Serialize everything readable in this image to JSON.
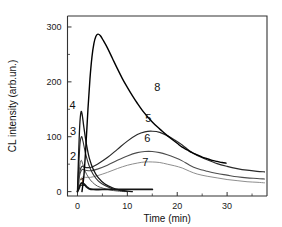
{
  "chart_data": {
    "type": "line",
    "title": "",
    "xlabel": "Time (min)",
    "ylabel": "CL intensity (arb.un.)",
    "xlim": [
      -2,
      38
    ],
    "ylim": [
      -8,
      320
    ],
    "xticks": [
      0,
      10,
      20,
      30
    ],
    "yticks": [
      0,
      100,
      200,
      300
    ],
    "xtick_labels": [
      "0",
      "10",
      "20",
      "30"
    ],
    "ytick_labels": [
      "0",
      "100",
      "200",
      "300"
    ],
    "grid": false,
    "legend": "inline curve numbers",
    "series": [
      {
        "name": "1",
        "label": "1",
        "label_x": 1.0,
        "label_y": 10,
        "color": "#141414",
        "width": 1.9,
        "points": [
          [
            0,
            0
          ],
          [
            0.3,
            6
          ],
          [
            0.6,
            13
          ],
          [
            0.9,
            16
          ],
          [
            1.3,
            14
          ],
          [
            1.8,
            9
          ],
          [
            2.4,
            5
          ],
          [
            3.2,
            4
          ],
          [
            5,
            4
          ],
          [
            8,
            4
          ],
          [
            11,
            4
          ],
          [
            15,
            4
          ]
        ]
      },
      {
        "name": "2",
        "label": "2",
        "label_x": -0.9,
        "label_y": 58,
        "color": "#5a5a5a",
        "width": 1.0,
        "points": [
          [
            0,
            0
          ],
          [
            0.25,
            26
          ],
          [
            0.5,
            50
          ],
          [
            0.75,
            57
          ],
          [
            1.0,
            52
          ],
          [
            1.5,
            38
          ],
          [
            2.2,
            26
          ],
          [
            3.0,
            17
          ],
          [
            4.0,
            10
          ],
          [
            5.2,
            6
          ],
          [
            6.5,
            3
          ],
          [
            8,
            1
          ],
          [
            9.5,
            0
          ]
        ]
      },
      {
        "name": "3",
        "label": "3",
        "label_x": -0.9,
        "label_y": 104,
        "color": "#2e2e2e",
        "width": 1.1,
        "points": [
          [
            0,
            0
          ],
          [
            0.25,
            45
          ],
          [
            0.5,
            86
          ],
          [
            0.8,
            100
          ],
          [
            1.1,
            92
          ],
          [
            1.6,
            70
          ],
          [
            2.3,
            48
          ],
          [
            3.1,
            32
          ],
          [
            4.2,
            19
          ],
          [
            5.5,
            11
          ],
          [
            7,
            5
          ],
          [
            8.5,
            2
          ],
          [
            10,
            0
          ]
        ]
      },
      {
        "name": "4",
        "label": "4",
        "label_x": -1.0,
        "label_y": 151,
        "color": "#141414",
        "width": 1.3,
        "points": [
          [
            0,
            0
          ],
          [
            0.2,
            60
          ],
          [
            0.45,
            120
          ],
          [
            0.7,
            145
          ],
          [
            0.95,
            140
          ],
          [
            1.3,
            116
          ],
          [
            1.8,
            86
          ],
          [
            2.4,
            60
          ],
          [
            3.2,
            40
          ],
          [
            4.2,
            25
          ],
          [
            5.5,
            14
          ],
          [
            7,
            7
          ],
          [
            8.5,
            3
          ],
          [
            10,
            1
          ],
          [
            11,
            0
          ]
        ]
      },
      {
        "name": "5",
        "label": "5",
        "label_x": 14.2,
        "label_y": 126,
        "color": "#2a2a2a",
        "width": 1.2,
        "points": [
          [
            0,
            0
          ],
          [
            0.4,
            34
          ],
          [
            0.9,
            46
          ],
          [
            1.6,
            44
          ],
          [
            2.6,
            44
          ],
          [
            4,
            50
          ],
          [
            6,
            62
          ],
          [
            8,
            77
          ],
          [
            10,
            92
          ],
          [
            12,
            104
          ],
          [
            13.5,
            109
          ],
          [
            15,
            110
          ],
          [
            16.5,
            108
          ],
          [
            18,
            102
          ],
          [
            19.5,
            94
          ],
          [
            21,
            85
          ],
          [
            22.5,
            74
          ],
          [
            24,
            66
          ],
          [
            26,
            58
          ],
          [
            28,
            51
          ],
          [
            30,
            46
          ],
          [
            32,
            42
          ],
          [
            34,
            39
          ],
          [
            36,
            37
          ],
          [
            37.5,
            36
          ]
        ]
      },
      {
        "name": "6",
        "label": "6",
        "label_x": 14.0,
        "label_y": 90,
        "color": "#4d4d4d",
        "width": 1.1,
        "points": [
          [
            0,
            0
          ],
          [
            0.4,
            28
          ],
          [
            0.9,
            40
          ],
          [
            1.6,
            39
          ],
          [
            2.6,
            38
          ],
          [
            4,
            41
          ],
          [
            6,
            48
          ],
          [
            8,
            57
          ],
          [
            10,
            65
          ],
          [
            12,
            71
          ],
          [
            13.5,
            73
          ],
          [
            15,
            73
          ],
          [
            16.5,
            71
          ],
          [
            18,
            67
          ],
          [
            19.5,
            62
          ],
          [
            21,
            56
          ],
          [
            22.5,
            48
          ],
          [
            24,
            42
          ],
          [
            26,
            37
          ],
          [
            28,
            33
          ],
          [
            30,
            30
          ],
          [
            32,
            27
          ],
          [
            34,
            25
          ],
          [
            36,
            24
          ],
          [
            37.5,
            23
          ]
        ]
      },
      {
        "name": "7",
        "label": "7",
        "label_x": 13.6,
        "label_y": 47,
        "color": "#8e8e8e",
        "width": 1.0,
        "points": [
          [
            0,
            0
          ],
          [
            0.4,
            18
          ],
          [
            0.9,
            26
          ],
          [
            1.6,
            26
          ],
          [
            2.6,
            26
          ],
          [
            4,
            29
          ],
          [
            6,
            35
          ],
          [
            8,
            42
          ],
          [
            10,
            48
          ],
          [
            12,
            52
          ],
          [
            13.5,
            54
          ],
          [
            15,
            54
          ],
          [
            16.5,
            53
          ],
          [
            18,
            50
          ],
          [
            19.5,
            47
          ],
          [
            21,
            43
          ],
          [
            22.5,
            37
          ],
          [
            24,
            32
          ],
          [
            26,
            28
          ],
          [
            28,
            25
          ],
          [
            30,
            22
          ],
          [
            32,
            20
          ],
          [
            34,
            18
          ],
          [
            36,
            17
          ],
          [
            37.5,
            16
          ]
        ]
      },
      {
        "name": "8",
        "label": "8",
        "label_x": 16.0,
        "label_y": 183,
        "color": "#000000",
        "width": 1.4,
        "points": [
          [
            0.9,
            0
          ],
          [
            1.3,
            30
          ],
          [
            1.7,
            85
          ],
          [
            2.1,
            150
          ],
          [
            2.5,
            205
          ],
          [
            2.9,
            245
          ],
          [
            3.3,
            270
          ],
          [
            3.7,
            283
          ],
          [
            4.1,
            287
          ],
          [
            4.6,
            284
          ],
          [
            5.2,
            275
          ],
          [
            6,
            262
          ],
          [
            7,
            243
          ],
          [
            8,
            224
          ],
          [
            9,
            206
          ],
          [
            10,
            190
          ],
          [
            11,
            175
          ],
          [
            12,
            161
          ],
          [
            13,
            148
          ],
          [
            14,
            137
          ],
          [
            15,
            127
          ],
          [
            16,
            118
          ],
          [
            17,
            110
          ],
          [
            18,
            102
          ],
          [
            19,
            95
          ],
          [
            20,
            88
          ],
          [
            21,
            81
          ],
          [
            22,
            76
          ],
          [
            23,
            71
          ],
          [
            24,
            67
          ],
          [
            25,
            63
          ],
          [
            26,
            60
          ],
          [
            27,
            57
          ],
          [
            28,
            55
          ],
          [
            29,
            53
          ],
          [
            29.8,
            52
          ]
        ]
      }
    ]
  }
}
